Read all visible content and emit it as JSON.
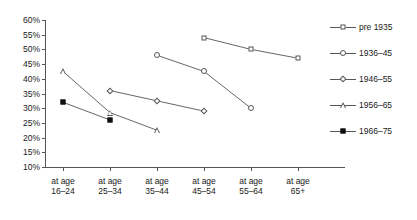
{
  "chart_data": {
    "type": "line",
    "title": "",
    "xlabel": "",
    "ylabel": "",
    "ylim": [
      10,
      60
    ],
    "ytick_labels": [
      "60%",
      "55%",
      "50%",
      "45%",
      "40%",
      "35%",
      "30%",
      "25%",
      "20%",
      "15%",
      "10%"
    ],
    "ytick_values": [
      60,
      55,
      50,
      45,
      40,
      35,
      30,
      25,
      20,
      15,
      10
    ],
    "grid": false,
    "legend_position": "right",
    "categories": [
      "at age\n16–24",
      "at age\n25–34",
      "at age\n35–44",
      "at age\n45–54",
      "at age\n55–64",
      "at age\n65+"
    ],
    "category_lines": [
      [
        "at age",
        "16–24"
      ],
      [
        "at age",
        "25–34"
      ],
      [
        "at age",
        "35–44"
      ],
      [
        "at age",
        "45–54"
      ],
      [
        "at age",
        "55–64"
      ],
      [
        "at age",
        "65+"
      ]
    ],
    "series": [
      {
        "name": "pre 1935",
        "marker": "open-square",
        "values": [
          null,
          null,
          null,
          54,
          50,
          47
        ]
      },
      {
        "name": "1936–45",
        "marker": "open-circle",
        "values": [
          null,
          null,
          48,
          42.5,
          30,
          null
        ]
      },
      {
        "name": "1946–55",
        "marker": "open-diamond",
        "values": [
          null,
          36,
          32.5,
          29,
          null,
          null
        ]
      },
      {
        "name": "1956–65",
        "marker": "open-triangle",
        "values": [
          42.5,
          28.5,
          22.5,
          null,
          null,
          null
        ]
      },
      {
        "name": "1966–75",
        "marker": "filled-square",
        "values": [
          32,
          26,
          null,
          null,
          null,
          null
        ]
      }
    ],
    "axis_color": "#555555",
    "line_color": "#555555",
    "marker_fill": "#ffffff",
    "filled_marker_color": "#111111"
  },
  "legend": {
    "items": [
      {
        "label": "pre 1935",
        "marker": "open-square"
      },
      {
        "label": "1936–45",
        "marker": "open-circle"
      },
      {
        "label": "1946–55",
        "marker": "open-diamond"
      },
      {
        "label": "1956–65",
        "marker": "open-triangle"
      },
      {
        "label": "1966–75",
        "marker": "filled-square"
      }
    ]
  }
}
